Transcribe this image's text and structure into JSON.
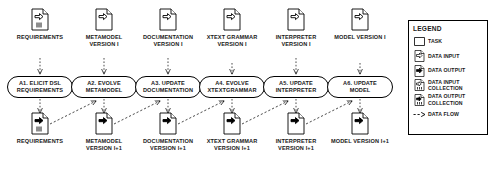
{
  "diagram": {
    "colors": {
      "stroke": "#000000",
      "fill": "#ffffff",
      "text": "#1a1a1a"
    }
  },
  "inputs": [
    {
      "label": "REQUIREMENTS",
      "icon": "data-input-collection-icon"
    },
    {
      "label": "METAMODEL VERSION i",
      "icon": "data-input-icon"
    },
    {
      "label": "DOCUMENTATION VERSION i",
      "icon": "data-input-icon"
    },
    {
      "label": "XTEXT GRAMMAR VERSION i",
      "icon": "data-input-icon"
    },
    {
      "label": "INTERPRETER VERSION i",
      "icon": "data-input-icon"
    },
    {
      "label": "MODEL VERSION i",
      "icon": "data-input-icon"
    }
  ],
  "tasks": [
    {
      "line1": "A1. ELICIT DSL",
      "line2": "REQUIREMENTS"
    },
    {
      "line1": "A2. EVOLVE",
      "line2": "METAMODEL"
    },
    {
      "line1": "A3. UPDATE",
      "line2": "DOCUMENTATION"
    },
    {
      "line1": "A4. EVOLVE",
      "line2": "XTEXTGRAMMAR"
    },
    {
      "line1": "A5. UPDATE",
      "line2": "INTERPRETER"
    },
    {
      "line1": "A6. UPDATE",
      "line2": "MODEL"
    }
  ],
  "outputs": [
    {
      "label": "REQUIREMENTS",
      "icon": "data-output-collection-icon"
    },
    {
      "label": "METAMODEL VERSION i+1",
      "icon": "data-output-icon"
    },
    {
      "label": "DOCUMENTATION VERSION i+1",
      "icon": "data-output-icon"
    },
    {
      "label": "XTEXT GRAMMAR VERSION i+1",
      "icon": "data-output-icon"
    },
    {
      "label": "INTERPRETER VERSION i+1",
      "icon": "data-output-icon"
    },
    {
      "label": "MODEL VERSION i+1",
      "icon": "data-output-icon"
    }
  ],
  "legend": {
    "title": "LEGEND",
    "items": [
      {
        "label": "TASK",
        "icon": "task-icon"
      },
      {
        "label": "DATA INPUT",
        "icon": "data-input-icon"
      },
      {
        "label": "DATA OUTPUT",
        "icon": "data-output-icon"
      },
      {
        "label": "DATA INPUT COLLECTION",
        "icon": "data-input-collection-icon"
      },
      {
        "label": "DATA OUTPUT COLLECTION",
        "icon": "data-output-collection-icon"
      },
      {
        "label": "DATA FLOW",
        "icon": "data-flow-icon"
      }
    ]
  }
}
